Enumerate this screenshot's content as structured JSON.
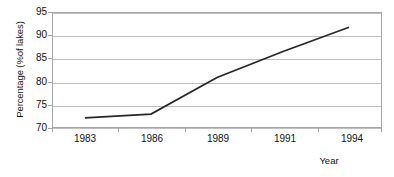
{
  "chart_data": {
    "type": "line",
    "title": "",
    "xlabel": "Year",
    "ylabel": "Percentage (%of lakes)",
    "categories": [
      "1983",
      "1986",
      "1989",
      "1991",
      "1994"
    ],
    "series": [
      {
        "name": "Percentage of lakes",
        "values": [
          72.2,
          73.0,
          80.9,
          86.5,
          91.7
        ],
        "color": "#262626"
      }
    ],
    "ylim": [
      70,
      95
    ],
    "yticks": [
      70,
      75,
      80,
      85,
      90,
      95
    ],
    "ytick_labels": [
      "70",
      "75",
      "80",
      "85",
      "90",
      "95"
    ],
    "xtick_labels": [
      "1983",
      "1986",
      "1989",
      "1991",
      "1994"
    ],
    "grid": "horizontal",
    "legend": "none",
    "colors": {
      "line": "#262626",
      "gridline": "#bfbfbf",
      "axis": "#a6a6a6",
      "text": "#111111",
      "background": "#ffffff"
    }
  }
}
